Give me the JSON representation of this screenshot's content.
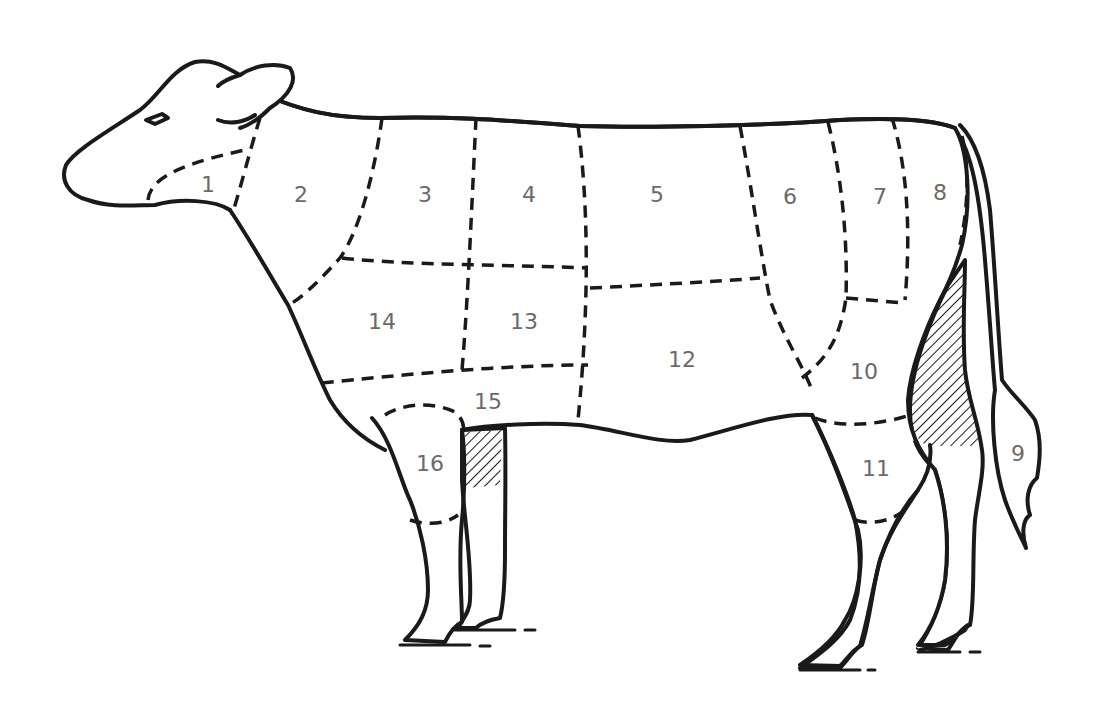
{
  "diagram": {
    "stroke_color": "#1a1a1a",
    "label_color": "#6a6a6a",
    "regions": [
      {
        "id": "1",
        "label": "1"
      },
      {
        "id": "2",
        "label": "2"
      },
      {
        "id": "3",
        "label": "3"
      },
      {
        "id": "4",
        "label": "4"
      },
      {
        "id": "5",
        "label": "5"
      },
      {
        "id": "6",
        "label": "6"
      },
      {
        "id": "7",
        "label": "7"
      },
      {
        "id": "8",
        "label": "8"
      },
      {
        "id": "9",
        "label": "9"
      },
      {
        "id": "10",
        "label": "10"
      },
      {
        "id": "11",
        "label": "11"
      },
      {
        "id": "12",
        "label": "12"
      },
      {
        "id": "13",
        "label": "13"
      },
      {
        "id": "14",
        "label": "14"
      },
      {
        "id": "15",
        "label": "15"
      },
      {
        "id": "16",
        "label": "16"
      }
    ]
  }
}
